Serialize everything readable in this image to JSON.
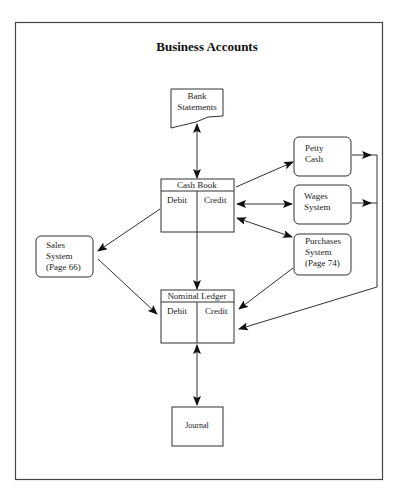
{
  "title": "Business Accounts",
  "nodes": {
    "bank_statements": {
      "line1": "Bank",
      "line2": "Statements"
    },
    "cash_book": {
      "header": "Cash Book",
      "left": "Debit",
      "right": "Credit"
    },
    "petty_cash": {
      "line1": "Petty",
      "line2": "Cash"
    },
    "wages_system": {
      "line1": "Wages",
      "line2": "System"
    },
    "purchases_system": {
      "line1": "Purchases",
      "line2": "System",
      "line3": "(Page 74)"
    },
    "sales_system": {
      "line1": "Sales",
      "line2": "System",
      "line3": "(Page 66)"
    },
    "nominal_ledger": {
      "header": "Nominal Ledger",
      "left": "Debit",
      "right": "Credit"
    },
    "journal": {
      "label": "Journal"
    }
  },
  "edges": [
    {
      "from": "bank_statements",
      "to": "cash_book",
      "type": "bidirectional"
    },
    {
      "from": "cash_book",
      "to": "petty_cash",
      "type": "directed"
    },
    {
      "from": "cash_book",
      "to": "wages_system",
      "type": "bidirectional"
    },
    {
      "from": "cash_book",
      "to": "purchases_system",
      "type": "bidirectional"
    },
    {
      "from": "cash_book",
      "to": "sales_system",
      "type": "directed"
    },
    {
      "from": "cash_book",
      "to": "nominal_ledger",
      "type": "directed"
    },
    {
      "from": "sales_system",
      "to": "nominal_ledger",
      "type": "directed"
    },
    {
      "from": "purchases_system",
      "to": "nominal_ledger",
      "type": "directed"
    },
    {
      "from": "petty_cash",
      "to": "nominal_ledger",
      "type": "directed"
    },
    {
      "from": "wages_system",
      "to": "nominal_ledger",
      "type": "directed"
    },
    {
      "from": "nominal_ledger",
      "to": "journal",
      "type": "bidirectional"
    }
  ]
}
